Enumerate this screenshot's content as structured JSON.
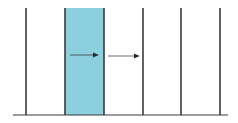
{
  "diagram": {
    "background": "#ffffff",
    "line_color": "#3a3a3a",
    "fill_color": "#8ccfdd",
    "baseline": {
      "y": 115,
      "x1": 13,
      "x2": 228
    },
    "vertical_lines": [
      {
        "x": 26,
        "y1": 8,
        "y2": 115
      },
      {
        "x": 65,
        "y1": 8,
        "y2": 115
      },
      {
        "x": 104,
        "y1": 8,
        "y2": 115
      },
      {
        "x": 143,
        "y1": 8,
        "y2": 115
      },
      {
        "x": 181,
        "y1": 8,
        "y2": 115
      },
      {
        "x": 220,
        "y1": 8,
        "y2": 115
      }
    ],
    "highlighted_region": {
      "x1": 65,
      "x2": 104,
      "y1": 8,
      "y2": 115
    },
    "arrows": [
      {
        "x1": 70,
        "x2": 98,
        "y": 55
      },
      {
        "x1": 108,
        "x2": 139,
        "y": 56
      }
    ]
  }
}
